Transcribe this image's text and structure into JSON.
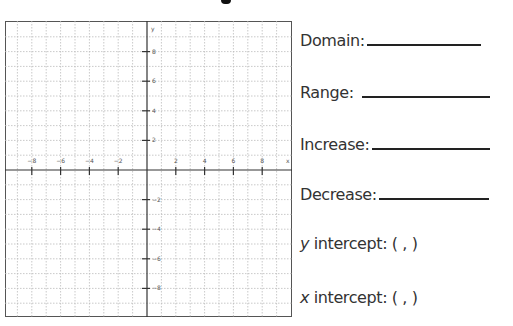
{
  "worksheet": {
    "graph": {
      "x_axis_label": "x",
      "y_axis_label": "y",
      "x_ticks": [
        "-8",
        "-6",
        "-4",
        "-2",
        "2",
        "4",
        "6",
        "8"
      ],
      "y_ticks": [
        "8",
        "6",
        "4",
        "2",
        "-2",
        "-4",
        "-6",
        "-8"
      ]
    },
    "fields": {
      "domain": "Domain:",
      "range": "Range:",
      "increase": "Increase:",
      "decrease": "Decrease:",
      "y_intercept_var": "y",
      "y_intercept_label": " intercept: (   ,   )",
      "x_intercept_var": "x",
      "x_intercept_label": " intercept: (   ,   )"
    }
  },
  "chart_data": {
    "type": "scatter",
    "title": "",
    "xlabel": "x",
    "ylabel": "y",
    "xlim": [
      -10,
      10
    ],
    "ylim": [
      -10,
      10
    ],
    "x_ticks": [
      -8,
      -6,
      -4,
      -2,
      2,
      4,
      6,
      8
    ],
    "y_ticks": [
      -8,
      -6,
      -4,
      -2,
      2,
      4,
      6,
      8
    ],
    "grid": true,
    "series": []
  }
}
